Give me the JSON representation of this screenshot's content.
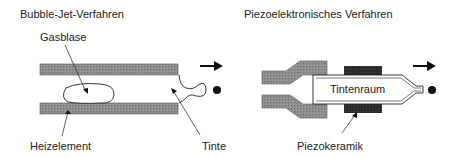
{
  "left": {
    "title": "Bubble-Jet-Verfahren",
    "labels": {
      "bubble": "Gasblase",
      "heater": "Heizelement",
      "ink": "Tinte"
    }
  },
  "right": {
    "title": "Piezoelektronisches Verfahren",
    "labels": {
      "chamber": "Tintenraum",
      "piezo": "Piezokeramik"
    }
  },
  "colors": {
    "wall": "#8a8a8a",
    "piezo": "#2a2a2a",
    "line": "#222222"
  }
}
